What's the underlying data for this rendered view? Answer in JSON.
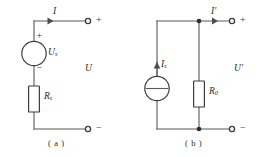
{
  "figure": {
    "background_color": "#ffffff",
    "line_color": "#58595b",
    "label_color": "#2b2b2b"
  },
  "circuit_a": {
    "caption": "( a )",
    "type": "voltage-source-model",
    "labels": {
      "current": "I",
      "source_base": "U",
      "source_subscript": "s",
      "resistor_base": "R",
      "resistor_subscript": "s",
      "port_voltage": "U",
      "source_plus": "+",
      "source_minus": "−",
      "terminal_plus": "+",
      "terminal_minus": "−"
    },
    "elements": [
      "ideal-voltage-source",
      "series-resistor",
      "output-terminal-positive",
      "output-terminal-negative"
    ]
  },
  "circuit_b": {
    "caption": "( b )",
    "type": "current-source-model",
    "labels": {
      "current": "I",
      "current_prime": "′",
      "source_base": "I",
      "source_subscript": "s",
      "resistor_base": "R",
      "resistor_subscript": "0",
      "port_voltage": "U",
      "port_voltage_prime": "′",
      "terminal_plus": "+",
      "terminal_minus": "−"
    },
    "elements": [
      "ideal-current-source",
      "parallel-resistor",
      "output-terminal-positive",
      "output-terminal-negative"
    ]
  }
}
